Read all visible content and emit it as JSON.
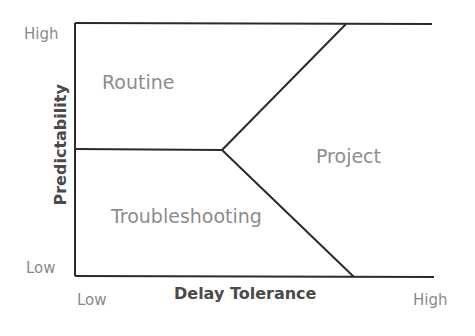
{
  "diagram": {
    "x_axis": {
      "title": "Delay Tolerance",
      "low_label": "Low",
      "high_label": "High"
    },
    "y_axis": {
      "title": "Predictability",
      "low_label": "Low",
      "high_label": "High"
    },
    "regions": [
      {
        "name": "Routine",
        "position": "upper-left"
      },
      {
        "name": "Troubleshooting",
        "position": "lower-left"
      },
      {
        "name": "Project",
        "position": "right"
      }
    ],
    "line_color": "#2a2a2a",
    "text_color": "#8a8a8a"
  }
}
